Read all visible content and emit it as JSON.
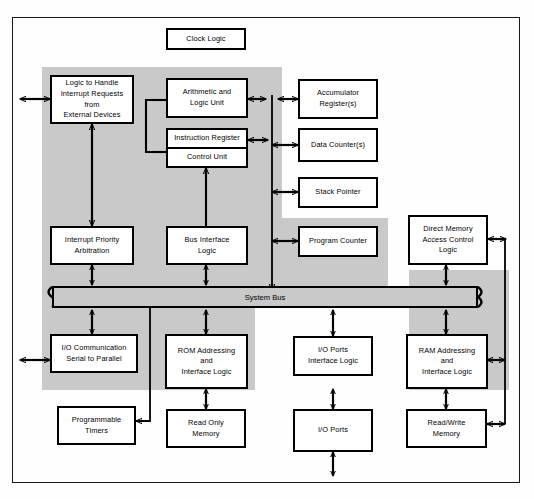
{
  "diagram": {
    "accent_color": "#c9c9c9",
    "line_color": "#000000",
    "background_color": "#ffffff"
  },
  "blocks": {
    "clock_logic": "Clock Logic",
    "interrupt_logic_l1": "Logic to Handle",
    "interrupt_logic_l2": "Interrupt Requests",
    "interrupt_logic_l3": "from",
    "interrupt_logic_l4": "External Devices",
    "alu_l1": "Arithmetic and",
    "alu_l2": "Logic Unit",
    "instruction_register": "Instruction Register",
    "control_unit": "Control Unit",
    "accumulator_l1": "Accumulator",
    "accumulator_l2": "Register(s)",
    "data_counters": "Data Counter(s)",
    "stack_pointer": "Stack Pointer",
    "interrupt_priority_l1": "Interrupt Priority",
    "interrupt_priority_l2": "Arbitration",
    "bus_interface_l1": "Bus Interface",
    "bus_interface_l2": "Logic",
    "program_counter": "Program Counter",
    "dma_l1": "Direct Memory",
    "dma_l2": "Access Control",
    "dma_l3": "Logic",
    "system_bus": "System Bus",
    "io_comm_l1": "I/O Communication",
    "io_comm_l2": "Serial to Parallel",
    "rom_addressing_l1": "ROM Addressing",
    "rom_addressing_l2": "and",
    "rom_addressing_l3": "Interface Logic",
    "io_ports_if_l1": "I/O Ports",
    "io_ports_if_l2": "Interface Logic",
    "ram_addressing_l1": "RAM Addressing",
    "ram_addressing_l2": "and",
    "ram_addressing_l3": "Interface Logic",
    "programmable_timers_l1": "Programmable",
    "programmable_timers_l2": "Timers",
    "read_only_memory_l1": "Read Only",
    "read_only_memory_l2": "Memory",
    "io_ports": "I/O Ports",
    "read_write_memory_l1": "Read/Write",
    "read_write_memory_l2": "Memory"
  }
}
